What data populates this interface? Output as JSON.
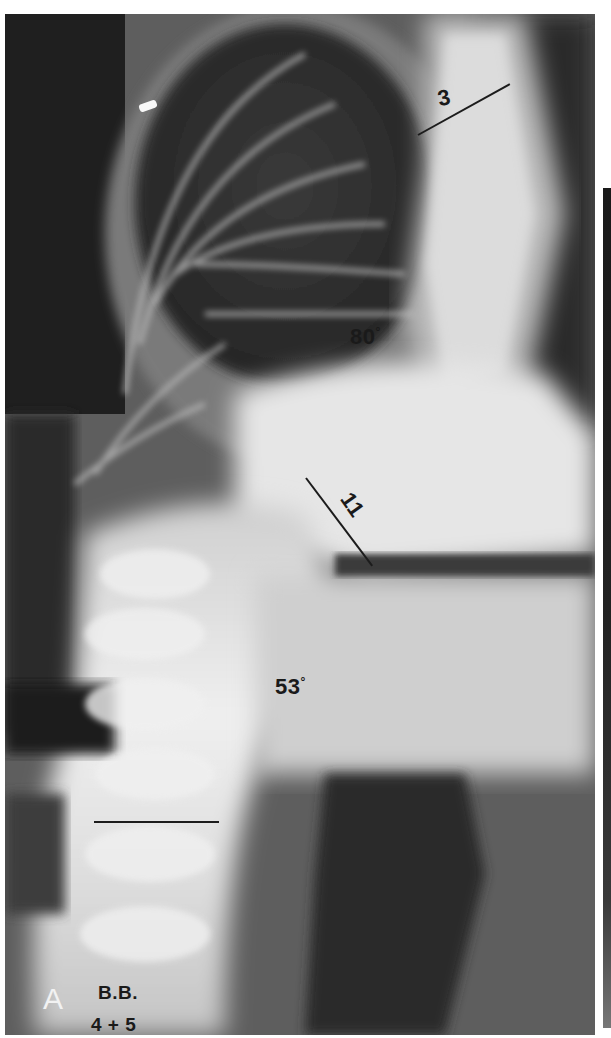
{
  "figure": {
    "panel_label": "A",
    "patient_initials": "B.B.",
    "patient_age": "4 + 5",
    "annotations": [
      {
        "id": "vertebra-upper",
        "label": "3"
      },
      {
        "id": "curve-upper",
        "label": "80",
        "unit": "°"
      },
      {
        "id": "vertebra-apex",
        "label": "11"
      },
      {
        "id": "curve-lower",
        "label": "53",
        "unit": "°"
      }
    ]
  },
  "colors": {
    "background": "#ffffff",
    "film_dark": "#1e1e1e",
    "bone_light": "#e8e8e8",
    "annotation_ink": "#1a1a1a",
    "panel_label": "#f2f2f2"
  }
}
